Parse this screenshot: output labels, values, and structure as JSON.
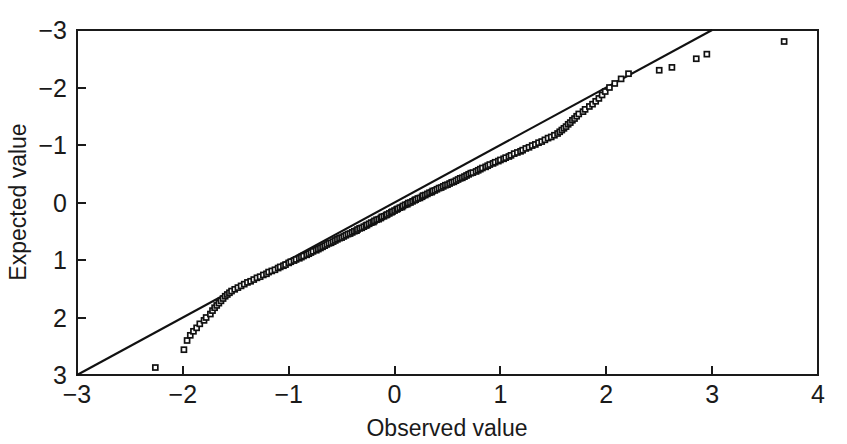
{
  "chart_data": {
    "type": "scatter",
    "title": "",
    "subtitle": "",
    "xlabel": "Observed value",
    "ylabel": "Expected value",
    "xlim": [
      -3,
      4
    ],
    "ylim": [
      -3,
      3
    ],
    "xticks": [
      -3,
      -2,
      -1,
      0,
      1,
      2,
      3,
      4
    ],
    "xticklabels": [
      "−3",
      "−2",
      "−1",
      "0",
      "1",
      "2",
      "3",
      "4"
    ],
    "yticks": [
      -3,
      -2,
      -1,
      0,
      1,
      2,
      3
    ],
    "yticklabels": [
      "−3",
      "−2",
      "−1",
      "0",
      "1",
      "2",
      "3"
    ],
    "grid": false,
    "legend": null,
    "legend_position": "none",
    "marker": "open-square",
    "marker_size": 5,
    "series": [
      {
        "name": "Q-Q points",
        "type": "scatter",
        "points": [
          [
            -2.26,
            -2.87
          ],
          [
            -1.99,
            -2.56
          ],
          [
            -1.96,
            -2.4
          ],
          [
            -1.93,
            -2.31
          ],
          [
            -1.9,
            -2.24
          ],
          [
            -1.87,
            -2.18
          ],
          [
            -1.84,
            -2.11
          ],
          [
            -1.8,
            -2.05
          ],
          [
            -1.78,
            -2.0
          ],
          [
            -1.74,
            -1.94
          ],
          [
            -1.72,
            -1.88
          ],
          [
            -1.7,
            -1.83
          ],
          [
            -1.68,
            -1.79
          ],
          [
            -1.66,
            -1.75
          ],
          [
            -1.64,
            -1.71
          ],
          [
            -1.62,
            -1.67
          ],
          [
            -1.6,
            -1.63
          ],
          [
            -1.58,
            -1.6
          ],
          [
            -1.56,
            -1.57
          ],
          [
            -1.54,
            -1.54
          ],
          [
            -1.51,
            -1.51
          ],
          [
            -1.48,
            -1.48
          ],
          [
            -1.45,
            -1.45
          ],
          [
            -1.42,
            -1.42
          ],
          [
            -1.39,
            -1.39
          ],
          [
            -1.36,
            -1.37
          ],
          [
            -1.33,
            -1.34
          ],
          [
            -1.3,
            -1.31
          ],
          [
            -1.27,
            -1.29
          ],
          [
            -1.24,
            -1.26
          ],
          [
            -1.21,
            -1.24
          ],
          [
            -1.19,
            -1.21
          ],
          [
            -1.16,
            -1.19
          ],
          [
            -1.13,
            -1.17
          ],
          [
            -1.1,
            -1.14
          ],
          [
            -1.08,
            -1.12
          ],
          [
            -1.05,
            -1.1
          ],
          [
            -1.03,
            -1.08
          ],
          [
            -1.0,
            -1.05
          ],
          [
            -0.98,
            -1.03
          ],
          [
            -0.95,
            -1.01
          ],
          [
            -0.93,
            -0.99
          ],
          [
            -0.9,
            -0.97
          ],
          [
            -0.88,
            -0.95
          ],
          [
            -0.86,
            -0.93
          ],
          [
            -0.83,
            -0.91
          ],
          [
            -0.81,
            -0.89
          ],
          [
            -0.79,
            -0.87
          ],
          [
            -0.77,
            -0.85
          ],
          [
            -0.74,
            -0.83
          ],
          [
            -0.72,
            -0.81
          ],
          [
            -0.7,
            -0.79
          ],
          [
            -0.68,
            -0.77
          ],
          [
            -0.66,
            -0.75
          ],
          [
            -0.64,
            -0.73
          ],
          [
            -0.62,
            -0.71
          ],
          [
            -0.6,
            -0.7
          ],
          [
            -0.58,
            -0.68
          ],
          [
            -0.56,
            -0.66
          ],
          [
            -0.54,
            -0.64
          ],
          [
            -0.52,
            -0.62
          ],
          [
            -0.5,
            -0.61
          ],
          [
            -0.48,
            -0.59
          ],
          [
            -0.46,
            -0.57
          ],
          [
            -0.44,
            -0.55
          ],
          [
            -0.42,
            -0.54
          ],
          [
            -0.4,
            -0.52
          ],
          [
            -0.38,
            -0.5
          ],
          [
            -0.36,
            -0.49
          ],
          [
            -0.35,
            -0.47
          ],
          [
            -0.33,
            -0.45
          ],
          [
            -0.31,
            -0.44
          ],
          [
            -0.29,
            -0.42
          ],
          [
            -0.27,
            -0.4
          ],
          [
            -0.26,
            -0.39
          ],
          [
            -0.24,
            -0.37
          ],
          [
            -0.22,
            -0.35
          ],
          [
            -0.2,
            -0.34
          ],
          [
            -0.19,
            -0.32
          ],
          [
            -0.17,
            -0.3
          ],
          [
            -0.15,
            -0.29
          ],
          [
            -0.13,
            -0.27
          ],
          [
            -0.12,
            -0.25
          ],
          [
            -0.1,
            -0.24
          ],
          [
            -0.08,
            -0.22
          ],
          [
            -0.07,
            -0.21
          ],
          [
            -0.05,
            -0.19
          ],
          [
            -0.03,
            -0.17
          ],
          [
            -0.02,
            -0.16
          ],
          [
            0.0,
            -0.14
          ],
          [
            0.02,
            -0.12
          ],
          [
            0.03,
            -0.11
          ],
          [
            0.05,
            -0.09
          ],
          [
            0.07,
            -0.08
          ],
          [
            0.08,
            -0.06
          ],
          [
            0.1,
            -0.04
          ],
          [
            0.12,
            -0.03
          ],
          [
            0.13,
            -0.01
          ],
          [
            0.15,
            0.0
          ],
          [
            0.17,
            0.02
          ],
          [
            0.19,
            0.04
          ],
          [
            0.2,
            0.05
          ],
          [
            0.22,
            0.07
          ],
          [
            0.24,
            0.08
          ],
          [
            0.26,
            0.1
          ],
          [
            0.27,
            0.12
          ],
          [
            0.29,
            0.13
          ],
          [
            0.31,
            0.15
          ],
          [
            0.33,
            0.17
          ],
          [
            0.35,
            0.18
          ],
          [
            0.36,
            0.2
          ],
          [
            0.38,
            0.21
          ],
          [
            0.4,
            0.23
          ],
          [
            0.42,
            0.25
          ],
          [
            0.44,
            0.26
          ],
          [
            0.46,
            0.28
          ],
          [
            0.48,
            0.3
          ],
          [
            0.5,
            0.31
          ],
          [
            0.52,
            0.33
          ],
          [
            0.54,
            0.35
          ],
          [
            0.56,
            0.36
          ],
          [
            0.58,
            0.38
          ],
          [
            0.6,
            0.4
          ],
          [
            0.62,
            0.42
          ],
          [
            0.64,
            0.43
          ],
          [
            0.66,
            0.45
          ],
          [
            0.68,
            0.47
          ],
          [
            0.7,
            0.49
          ],
          [
            0.72,
            0.51
          ],
          [
            0.74,
            0.52
          ],
          [
            0.77,
            0.54
          ],
          [
            0.79,
            0.56
          ],
          [
            0.81,
            0.58
          ],
          [
            0.83,
            0.6
          ],
          [
            0.86,
            0.62
          ],
          [
            0.88,
            0.64
          ],
          [
            0.9,
            0.66
          ],
          [
            0.93,
            0.68
          ],
          [
            0.95,
            0.7
          ],
          [
            0.98,
            0.72
          ],
          [
            1.0,
            0.74
          ],
          [
            1.03,
            0.76
          ],
          [
            1.05,
            0.78
          ],
          [
            1.08,
            0.8
          ],
          [
            1.1,
            0.82
          ],
          [
            1.13,
            0.85
          ],
          [
            1.16,
            0.87
          ],
          [
            1.19,
            0.89
          ],
          [
            1.21,
            0.91
          ],
          [
            1.24,
            0.94
          ],
          [
            1.27,
            0.96
          ],
          [
            1.3,
            0.99
          ],
          [
            1.33,
            1.01
          ],
          [
            1.36,
            1.04
          ],
          [
            1.39,
            1.06
          ],
          [
            1.42,
            1.09
          ],
          [
            1.45,
            1.12
          ],
          [
            1.48,
            1.14
          ],
          [
            1.51,
            1.17
          ],
          [
            1.54,
            1.2
          ],
          [
            1.56,
            1.23
          ],
          [
            1.58,
            1.26
          ],
          [
            1.6,
            1.29
          ],
          [
            1.62,
            1.32
          ],
          [
            1.64,
            1.36
          ],
          [
            1.66,
            1.39
          ],
          [
            1.68,
            1.43
          ],
          [
            1.7,
            1.46
          ],
          [
            1.72,
            1.5
          ],
          [
            1.74,
            1.54
          ],
          [
            1.78,
            1.58
          ],
          [
            1.8,
            1.62
          ],
          [
            1.84,
            1.67
          ],
          [
            1.87,
            1.71
          ],
          [
            1.9,
            1.76
          ],
          [
            1.93,
            1.81
          ],
          [
            1.96,
            1.87
          ],
          [
            1.99,
            1.93
          ],
          [
            2.03,
            2.0
          ],
          [
            2.08,
            2.07
          ],
          [
            2.14,
            2.15
          ],
          [
            2.21,
            2.24
          ],
          [
            2.5,
            2.3
          ],
          [
            2.62,
            2.35
          ],
          [
            2.85,
            2.5
          ],
          [
            2.95,
            2.58
          ],
          [
            3.68,
            2.8
          ]
        ]
      },
      {
        "name": "Reference line",
        "type": "line",
        "x": [
          -3,
          3
        ],
        "y": [
          -3,
          3
        ]
      }
    ],
    "annotations": []
  },
  "axes": {
    "x_label": "Observed value",
    "y_label": "Expected value",
    "x_tick_labels": [
      "−3",
      "−2",
      "−1",
      "0",
      "1",
      "2",
      "3",
      "4"
    ],
    "y_tick_labels": [
      "3",
      "2",
      "1",
      "0",
      "−1",
      "−2",
      "−3"
    ]
  },
  "colors": {
    "axis": "#1a1a1a",
    "marker_stroke": "#111111",
    "marker_fill": "#ffffff",
    "reference_line": "#111111",
    "background": "#ffffff"
  }
}
